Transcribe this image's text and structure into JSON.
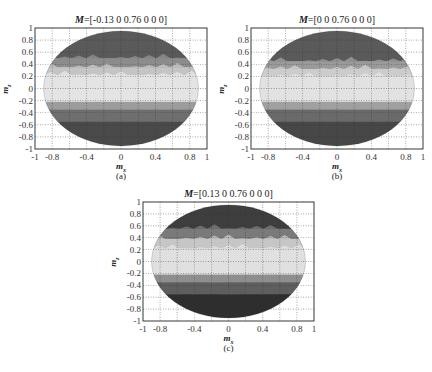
{
  "chart_data": [
    {
      "type": "heatmap",
      "panel": "a",
      "title_prefix": "M",
      "title_value": "=[-0.13 0 0.76 0 0 0]",
      "xlabel": "m",
      "xlabel_sub": "x",
      "ylabel": "m",
      "ylabel_sub": "z",
      "caption": "(a)",
      "xlim": [
        -1,
        1
      ],
      "ylim": [
        -1,
        1
      ],
      "xticks": [
        "-1",
        "-0.8",
        "-0.4",
        "0",
        "0.4",
        "0.8",
        "1"
      ],
      "xtick_values": [
        -1,
        -0.8,
        -0.4,
        0,
        0.4,
        0.8,
        1
      ],
      "yticks": [
        "1",
        "0.8",
        "0.6",
        "0.4",
        "0.2",
        "0",
        "-0.2",
        "-0.4",
        "-0.6",
        "-0.8",
        "-1"
      ],
      "ytick_values": [
        1,
        0.8,
        0.6,
        0.4,
        0.2,
        0,
        -0.2,
        -0.4,
        -0.6,
        -0.8,
        -1
      ],
      "grid": true,
      "ellipse": {
        "cx": 0,
        "cy": 0,
        "rx": 0.9,
        "ry": 0.95
      },
      "bands": [
        {
          "y_from": 0.95,
          "y_to": 0.5,
          "color": "#5a5a5a"
        },
        {
          "y_from": 0.5,
          "y_to": 0.35,
          "color": "#8c8c8c"
        },
        {
          "y_from": 0.35,
          "y_to": 0.22,
          "color": "#c4c4c4"
        },
        {
          "y_from": 0.22,
          "y_to": -0.22,
          "color": "#e4e4e4"
        },
        {
          "y_from": -0.22,
          "y_to": -0.35,
          "color": "#9c9c9c"
        },
        {
          "y_from": -0.35,
          "y_to": -0.55,
          "color": "#6e6e6e"
        },
        {
          "y_from": -0.55,
          "y_to": -0.95,
          "color": "#4a4a4a"
        }
      ]
    },
    {
      "type": "heatmap",
      "panel": "b",
      "title_prefix": "M",
      "title_value": "=[0 0 0.76 0 0 0]",
      "xlabel": "m",
      "xlabel_sub": "x",
      "ylabel": "m",
      "ylabel_sub": "z",
      "caption": "(b)",
      "xlim": [
        -1,
        1
      ],
      "ylim": [
        -1,
        1
      ],
      "xticks": [
        "-1",
        "-0.8",
        "-0.4",
        "0",
        "0.4",
        "0.8",
        "1"
      ],
      "xtick_values": [
        -1,
        -0.8,
        -0.4,
        0,
        0.4,
        0.8,
        1
      ],
      "yticks": [
        "1",
        "0.8",
        "0.6",
        "0.4",
        "0.2",
        "0",
        "-0.2",
        "-0.4",
        "-0.6",
        "-0.8",
        "-1"
      ],
      "ytick_values": [
        1,
        0.8,
        0.6,
        0.4,
        0.2,
        0,
        -0.2,
        -0.4,
        -0.6,
        -0.8,
        -1
      ],
      "grid": true,
      "ellipse": {
        "cx": 0,
        "cy": 0,
        "rx": 0.9,
        "ry": 0.95
      },
      "bands": [
        {
          "y_from": 0.95,
          "y_to": 0.45,
          "color": "#5a5a5a"
        },
        {
          "y_from": 0.45,
          "y_to": 0.32,
          "color": "#9a9a9a"
        },
        {
          "y_from": 0.32,
          "y_to": 0.2,
          "color": "#cccccc"
        },
        {
          "y_from": 0.2,
          "y_to": -0.22,
          "color": "#e2e2e2"
        },
        {
          "y_from": -0.22,
          "y_to": -0.35,
          "color": "#a0a0a0"
        },
        {
          "y_from": -0.35,
          "y_to": -0.55,
          "color": "#6a6a6a"
        },
        {
          "y_from": -0.55,
          "y_to": -0.95,
          "color": "#474747"
        }
      ]
    },
    {
      "type": "heatmap",
      "panel": "c",
      "title_prefix": "M",
      "title_value": "=[0.13 0 0.76 0 0 0]",
      "xlabel": "m",
      "xlabel_sub": "x",
      "ylabel": "m",
      "ylabel_sub": "z",
      "caption": "(c)",
      "xlim": [
        -1,
        1
      ],
      "ylim": [
        -1,
        1
      ],
      "xticks": [
        "-1",
        "-0.8",
        "-0.4",
        "0",
        "0.4",
        "0.8",
        "1"
      ],
      "xtick_values": [
        -1,
        -0.8,
        -0.4,
        0,
        0.4,
        0.8,
        1
      ],
      "yticks": [
        "1",
        "0.8",
        "0.6",
        "0.4",
        "0.2",
        "0",
        "-0.2",
        "-0.4",
        "-0.6",
        "-0.8",
        "-1"
      ],
      "ytick_values": [
        1,
        0.8,
        0.6,
        0.4,
        0.2,
        0,
        -0.2,
        -0.4,
        -0.6,
        -0.8,
        -1
      ],
      "grid": true,
      "ellipse": {
        "cx": 0,
        "cy": 0,
        "rx": 0.9,
        "ry": 0.95
      },
      "bands": [
        {
          "y_from": 0.95,
          "y_to": 0.55,
          "color": "#3e3e3e"
        },
        {
          "y_from": 0.55,
          "y_to": 0.38,
          "color": "#7a7a7a"
        },
        {
          "y_from": 0.38,
          "y_to": 0.22,
          "color": "#c6c6c6"
        },
        {
          "y_from": 0.22,
          "y_to": -0.22,
          "color": "#e0e0e0"
        },
        {
          "y_from": -0.22,
          "y_to": -0.35,
          "color": "#8e8e8e"
        },
        {
          "y_from": -0.35,
          "y_to": -0.55,
          "color": "#5e5e5e"
        },
        {
          "y_from": -0.55,
          "y_to": -0.95,
          "color": "#2e2e2e"
        }
      ]
    }
  ]
}
